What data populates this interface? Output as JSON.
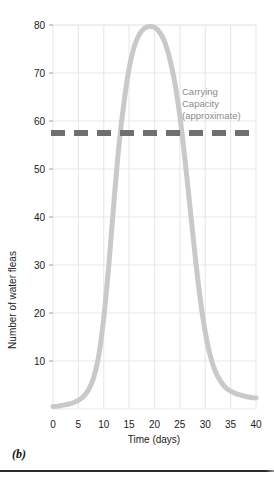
{
  "figure": {
    "panel_caption": "(b)"
  },
  "chart_data": {
    "type": "line",
    "title": "",
    "xlabel": "Time (days)",
    "ylabel": "Number of water fleas",
    "xlim": [
      0,
      40
    ],
    "ylim": [
      0,
      80
    ],
    "xticks": [
      0,
      5,
      10,
      15,
      20,
      25,
      30,
      35,
      40
    ],
    "xtick_labels": [
      "0",
      "5",
      "10",
      "15",
      "20",
      "25",
      "30",
      "35",
      "40"
    ],
    "yticks": [
      10,
      20,
      30,
      40,
      50,
      60,
      70,
      80
    ],
    "ytick_labels": [
      "10",
      "20",
      "30",
      "40",
      "50",
      "60",
      "70",
      "80"
    ],
    "grid": true,
    "legend": "none",
    "series": [
      {
        "name": "Water flea population",
        "color": "#c9c9c9",
        "line_width": 5,
        "x": [
          0,
          1,
          2,
          3,
          4,
          5,
          6,
          7,
          8,
          9,
          10,
          11,
          12,
          13,
          14,
          15,
          16,
          17,
          18,
          19,
          20,
          21,
          22,
          23,
          24,
          25,
          26,
          27,
          28,
          29,
          30,
          31,
          32,
          33,
          34,
          35,
          36,
          37,
          38,
          39,
          40
        ],
        "values": [
          0.5,
          0.6,
          0.8,
          1.0,
          1.3,
          1.8,
          2.6,
          4.0,
          6.5,
          11.0,
          19.0,
          30.0,
          43.0,
          55.0,
          64.0,
          71.0,
          75.5,
          78.0,
          79.3,
          79.7,
          79.5,
          78.5,
          76.5,
          73.0,
          68.0,
          61.0,
          52.0,
          42.0,
          32.0,
          23.0,
          16.0,
          11.0,
          7.8,
          5.8,
          4.5,
          3.7,
          3.2,
          2.9,
          2.6,
          2.4,
          2.3
        ]
      }
    ],
    "reference_lines": [
      {
        "name": "carrying-capacity",
        "orientation": "horizontal",
        "value": 57.5,
        "style": "dashed",
        "color": "#6f6f6f",
        "line_width": 6,
        "label_lines": [
          "Carrying",
          "Capacity",
          "(approximate)"
        ]
      }
    ],
    "annotations": [
      {
        "text": "Carrying",
        "x_px": 182,
        "y_px": 95
      },
      {
        "text": "Capacity",
        "x_px": 182,
        "y_px": 107
      },
      {
        "text": "(approximate)",
        "x_px": 182,
        "y_px": 119
      }
    ],
    "colors": {
      "curve": "#c9c9c9",
      "carrying_capacity": "#6f6f6f",
      "grid": "#e9e9e9",
      "axis_text": "#1a1a1a",
      "annotation_text": "#8b8b8b",
      "background": "#ffffff"
    }
  }
}
